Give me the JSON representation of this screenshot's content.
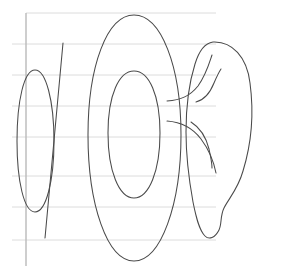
{
  "canvas": {
    "width": 287,
    "height": 277,
    "background_color": "#ffffff",
    "title": "Hand-drawn genus-two surface on ruled paper"
  },
  "palette": {
    "ink_color": "#4a4a4a",
    "rule_color": "#dcdcdc",
    "margin_rule_color": "#b9b9b9",
    "background_color": "#ffffff"
  },
  "stroke_widths": {
    "ink": 1.05,
    "rule": 1,
    "margin_rule": 1.4
  },
  "paper": {
    "margin_rule": {
      "name": "left-margin-rule",
      "x": 26,
      "y_top": 13,
      "y_bottom": 266
    },
    "horizontal_rules": [
      {
        "y": 13,
        "x_start": 26,
        "x_end": 216
      },
      {
        "y": 44,
        "x_start": 12,
        "x_end": 216
      },
      {
        "y": 75,
        "x_start": 12,
        "x_end": 216
      },
      {
        "y": 106,
        "x_start": 12,
        "x_end": 216
      },
      {
        "y": 137,
        "x_start": 12,
        "x_end": 216
      },
      {
        "y": 176,
        "x_start": 12,
        "x_end": 216
      },
      {
        "y": 207,
        "x_start": 12,
        "x_end": 216
      },
      {
        "y": 240,
        "x_start": 12,
        "x_end": 216
      }
    ]
  },
  "figure": {
    "strokes": [
      {
        "name": "left-small-ellipse",
        "description": "narrow vertical ellipse at far left",
        "path": "M 35 70 C 46 70 54 101 54 141 C 54 181 46 212 35 212 C 24 212 17 181 17 141 C 17 101 24 70 35 70 Z"
      },
      {
        "name": "diagonal-slash-line",
        "description": "long straight stroke crossing the left ellipse",
        "path": "M 63 43 L 45 238"
      },
      {
        "name": "center-outer-ellipse",
        "description": "large outer ellipse of the central torus",
        "path": "M 134 15 C 161 15 181 66 181 135 C 181 204 161 261 134 261 C 107 261 88 204 88 135 C 88 66 107 15 134 15 Z"
      },
      {
        "name": "center-inner-ellipse",
        "description": "inner hole ellipse of the central torus",
        "path": "M 134 71 C 149 71 160 95 160 133 C 160 171 149 198 134 198 C 119 198 108 171 108 133 C 108 95 119 71 134 71 Z"
      },
      {
        "name": "right-blob-outline",
        "description": "irregular blob forming the right handle body",
        "path": "M 213 42 C 232 41 247 57 250 83 C 254 113 251 145 243 171 C 238 189 229 198 224 208 C 220 216 222 224 219 230 C 215 238 209 240 205 236 C 199 230 196 217 193 202 C 189 180 186 155 186 132 C 186 108 189 83 195 64 C 199 51 205 43 213 42 Z"
      },
      {
        "name": "upper-neck-curve",
        "description": "upper tube curve joining central torus to right blob",
        "path": "M 167 101 C 181 100 190 96 198 86 C 206 75 209 64 212 55"
      },
      {
        "name": "upper-neck-inner-curve",
        "description": "short inner fold of the upper neck",
        "path": "M 196 102 C 204 100 210 93 214 83 C 217 76 219 72 221 69"
      },
      {
        "name": "lower-neck-curve",
        "description": "lower tube curve joining central torus to right blob",
        "path": "M 167 121 C 181 122 192 127 201 139 C 210 151 214 163 216 173"
      },
      {
        "name": "lower-neck-inner-curve",
        "description": "short inner fold of the lower neck",
        "path": "M 191 122 C 199 127 206 137 209 149 C 211 158 212 164 212 168"
      }
    ]
  }
}
